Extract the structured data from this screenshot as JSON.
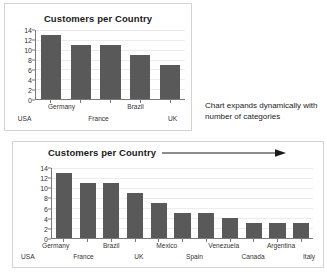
{
  "chart_data": [
    {
      "id": "top",
      "type": "bar",
      "title": "Customers per Country",
      "xlabel": "",
      "ylabel": "",
      "categories": [
        "USA",
        "Germany",
        "France",
        "Brazil",
        "UK"
      ],
      "values": [
        13,
        11,
        11,
        9,
        7
      ],
      "ylim": [
        0,
        14
      ],
      "yticks": [
        0,
        2,
        4,
        6,
        8,
        10,
        12,
        14
      ],
      "grid": true,
      "legend": "none",
      "bar_color": "#595959"
    },
    {
      "id": "bottom",
      "type": "bar",
      "title": "Customers per Country",
      "xlabel": "",
      "ylabel": "",
      "categories": [
        "USA",
        "Germany",
        "France",
        "Brazil",
        "UK",
        "Mexico",
        "Spain",
        "Venezuela",
        "Canada",
        "Argentina",
        "Italy"
      ],
      "values": [
        13,
        11,
        11,
        9,
        7,
        5,
        5,
        4,
        3,
        3,
        3
      ],
      "ylim": [
        0,
        14
      ],
      "yticks": [
        0,
        2,
        4,
        6,
        8,
        10,
        12,
        14
      ],
      "grid": true,
      "legend": "none",
      "bar_color": "#595959",
      "title_arrow": "→"
    }
  ],
  "annotation": {
    "text": "Chart expands dynamically with number of categories"
  }
}
